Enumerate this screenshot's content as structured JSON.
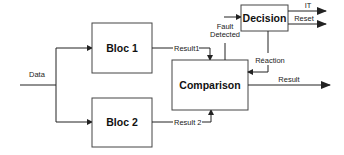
{
  "diagram": {
    "colors": {
      "stroke": "#222222",
      "box_fill": "#ffffff",
      "text": "#111111"
    },
    "blocks": {
      "bloc1": {
        "label": "Bloc 1"
      },
      "bloc2": {
        "label": "Bloc 2"
      },
      "comparison": {
        "label": "Comparison"
      },
      "decision": {
        "label": "Decision"
      }
    },
    "edges": {
      "data": {
        "label": "Data"
      },
      "result1": {
        "label": "Result1"
      },
      "result2": {
        "label": "Result 2"
      },
      "fault_detected": {
        "label_line1": "Fault",
        "label_line2": "Detected"
      },
      "reaction": {
        "label": "Réaction"
      },
      "it": {
        "label": "IT"
      },
      "reset": {
        "label": "Reset"
      },
      "result": {
        "label": "Result"
      }
    }
  }
}
